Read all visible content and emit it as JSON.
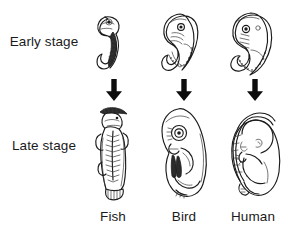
{
  "figure": {
    "background_color": "#ffffff",
    "ink_color": "#1b1b1b"
  },
  "rows": [
    {
      "id": "early",
      "label": "Early stage"
    },
    {
      "id": "late",
      "label": "Late stage"
    }
  ],
  "columns": [
    {
      "id": "fish",
      "label": "Fish"
    },
    {
      "id": "bird",
      "label": "Bird"
    },
    {
      "id": "human",
      "label": "Human"
    }
  ],
  "arrows": [
    {
      "id": "fish-arrow",
      "direction": "down",
      "icon": "arrow-down-icon"
    },
    {
      "id": "bird-arrow",
      "direction": "down",
      "icon": "arrow-down-icon"
    },
    {
      "id": "human-arrow",
      "direction": "down",
      "icon": "arrow-down-icon"
    }
  ],
  "illustrations": [
    {
      "id": "fish-early",
      "icon": "fish-early-embryo-illustration",
      "description": "Hook-shaped fish embryo, head at top with eye, dark shaded tail curling to the left"
    },
    {
      "id": "bird-early",
      "icon": "bird-early-embryo-illustration",
      "description": "Comma-shaped bird embryo with large eye, pharyngeal arches and segmented somites along curved tail"
    },
    {
      "id": "human-early",
      "icon": "human-early-embryo-illustration",
      "description": "C-shaped human embryo with large head, eye, pharyngeal arches and curled segmented tail"
    },
    {
      "id": "fish-late",
      "icon": "fish-late-larva-illustration",
      "description": "Elongated vertical fish larva with dark dorsal fin at top, segmented myomeres along the body and a fanned tail fin"
    },
    {
      "id": "bird-late",
      "icon": "bird-late-embryo-illustration",
      "description": "Curled bird embryo with prominent eye, beak, folded wing and leg"
    },
    {
      "id": "human-late",
      "icon": "human-late-fetus-illustration",
      "description": "Curled human fetus with rounded head, folded arms and legs and umbilical cord"
    }
  ]
}
